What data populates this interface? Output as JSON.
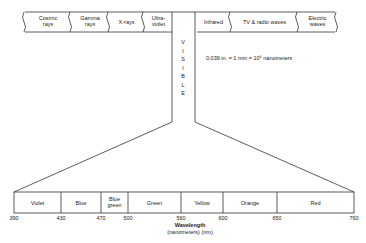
{
  "top_spectrum": {
    "segments": [
      {
        "label": "Cosmic rays",
        "l1": "Cosmic",
        "l2": "rays"
      },
      {
        "label": "Gamma rays",
        "l1": "Gamma",
        "l2": "rays"
      },
      {
        "label": "X-rays",
        "l1": "X-rays",
        "l2": ""
      },
      {
        "label": "Ultra-violet",
        "l1": "Ultra-",
        "l2": "violet"
      },
      {
        "label": "Infrared",
        "l1": "Infrared",
        "l2": ""
      },
      {
        "label": "TV & radio waves",
        "l1": "TV & radio waves",
        "l2": ""
      },
      {
        "label": "Electric waves",
        "l1": "Electric",
        "l2": "waves"
      }
    ],
    "visible_label": [
      "V",
      "I",
      "S",
      "I",
      "B",
      "L",
      "E"
    ]
  },
  "conversion_note": "0.039 in. = 1 mm = 10⁶ nanometers",
  "visible_spectrum": {
    "bands": [
      {
        "l1": "Violet",
        "l2": ""
      },
      {
        "l1": "Blue",
        "l2": ""
      },
      {
        "l1": "Blue",
        "l2": "green"
      },
      {
        "l1": "Green",
        "l2": ""
      },
      {
        "l1": "Yellow",
        "l2": ""
      },
      {
        "l1": "Orange",
        "l2": ""
      },
      {
        "l1": "Red",
        "l2": ""
      }
    ],
    "ticks": [
      "390",
      "430",
      "470",
      "500",
      "560",
      "600",
      "650",
      "760"
    ]
  },
  "axis_label": {
    "line1": "Wavelength",
    "line2": "(nanometers) (nm)"
  }
}
